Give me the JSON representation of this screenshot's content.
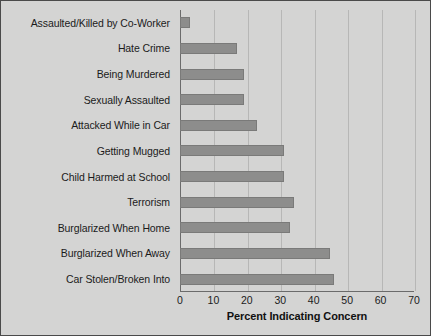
{
  "chart_data": {
    "type": "bar",
    "orientation": "horizontal",
    "title": "",
    "xlabel": "Percent Indicating Concern",
    "ylabel": "",
    "xlim": [
      0,
      70
    ],
    "xticks": [
      0,
      10,
      20,
      30,
      40,
      50,
      60,
      70
    ],
    "grid": "vertical",
    "legend": "none",
    "bar_color": "#8d8d8c",
    "background_color": "#d4d4d3",
    "categories": [
      "Assaulted/Killed by Co-Worker",
      "Hate Crime",
      "Being Murdered",
      "Sexually Assaulted",
      "Attacked While in Car",
      "Getting Mugged",
      "Child Harmed at School",
      "Terrorism",
      "Burglarized When Home",
      "Burglarized When Away",
      "Car Stolen/Broken Into"
    ],
    "values": [
      3,
      17,
      19,
      19,
      23,
      31,
      31,
      34,
      33,
      45,
      46
    ]
  }
}
